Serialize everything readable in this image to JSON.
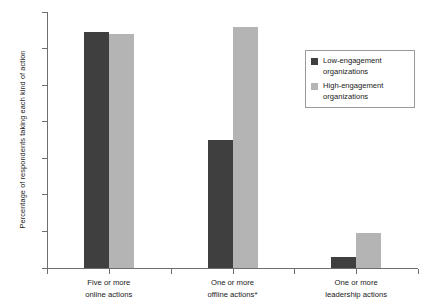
{
  "chart_data": {
    "type": "bar",
    "title": "",
    "xlabel": "",
    "ylabel": "Percentage of respondents taking each kind of action",
    "ylim": [
      0,
      14
    ],
    "ytick_labels": [
      "0%",
      "2%",
      "4%",
      "6%",
      "8%",
      "10%",
      "12%",
      "14%"
    ],
    "ytick_values": [
      0,
      2,
      4,
      6,
      8,
      10,
      12,
      14
    ],
    "grid": false,
    "legend_position": "right-top",
    "categories": [
      "Five or more online actions",
      "One or more offline actions*",
      "One or more leadership actions"
    ],
    "category_lines": [
      [
        "Five or more",
        "online actions"
      ],
      [
        "One or more",
        "offline actions*"
      ],
      [
        "One or more",
        "leadership actions"
      ]
    ],
    "series": [
      {
        "name": "Low-engagement organizations",
        "name_lines": [
          "Low-engagement",
          "organizations"
        ],
        "color": "#3f3f3f",
        "values": [
          12.9,
          7.0,
          0.6
        ]
      },
      {
        "name": "High-engagement organizations",
        "name_lines": [
          "High-engagement",
          "organizations"
        ],
        "color": "#b4b4b4",
        "values": [
          12.8,
          13.2,
          1.9
        ]
      }
    ],
    "footnote": "*"
  }
}
